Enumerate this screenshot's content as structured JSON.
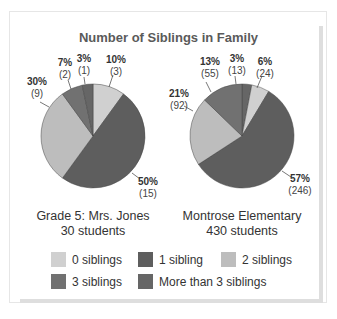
{
  "chart_data": [
    {
      "type": "pie",
      "title": "Number of Siblings in Family",
      "subtitle": "Grade 5: Mrs. Jones",
      "total_label": "30 students",
      "categories": [
        "0 siblings",
        "1 sibling",
        "2 siblings",
        "3 siblings",
        "More than 3 siblings"
      ],
      "values": [
        3,
        15,
        9,
        2,
        1
      ],
      "percents": [
        10,
        50,
        30,
        7,
        3
      ]
    },
    {
      "type": "pie",
      "title": "Number of Siblings in Family",
      "subtitle": "Montrose Elementary",
      "total_label": "430 students",
      "categories": [
        "0 siblings",
        "1 sibling",
        "2 siblings",
        "3 siblings",
        "More than 3 siblings"
      ],
      "values": [
        24,
        246,
        92,
        55,
        13
      ],
      "percents": [
        6,
        57,
        21,
        13,
        3
      ]
    }
  ],
  "title": "Number of Siblings in Family",
  "colors": {
    "0 siblings": "#d0d0d0",
    "1 sibling": "#5e5e5e",
    "2 siblings": "#bdbdbd",
    "3 siblings": "#717171",
    "More than 3 siblings": "#666666"
  },
  "left": {
    "caption_line1": "Grade 5: Mrs. Jones",
    "caption_line2": "30 students",
    "labels": {
      "zero": {
        "pct": "10%",
        "count": "(3)"
      },
      "one": {
        "pct": "50%",
        "count": "(15)"
      },
      "two": {
        "pct": "30%",
        "count": "(9)"
      },
      "three": {
        "pct": "7%",
        "count": "(2)"
      },
      "more": {
        "pct": "3%",
        "count": "(1)"
      }
    }
  },
  "right": {
    "caption_line1": "Montrose Elementary",
    "caption_line2": "430 students",
    "labels": {
      "zero": {
        "pct": "6%",
        "count": "(24)"
      },
      "one": {
        "pct": "57%",
        "count": "(246)"
      },
      "two": {
        "pct": "21%",
        "count": "(92)"
      },
      "three": {
        "pct": "13%",
        "count": "(55)"
      },
      "more": {
        "pct": "3%",
        "count": "(13)"
      }
    }
  },
  "legend": [
    {
      "label": "0 siblings",
      "color": "#d0d0d0"
    },
    {
      "label": "1 sibling",
      "color": "#5e5e5e"
    },
    {
      "label": "2 siblings",
      "color": "#bdbdbd"
    },
    {
      "label": "3 siblings",
      "color": "#717171"
    },
    {
      "label": "More than 3 siblings",
      "color": "#666666"
    }
  ]
}
